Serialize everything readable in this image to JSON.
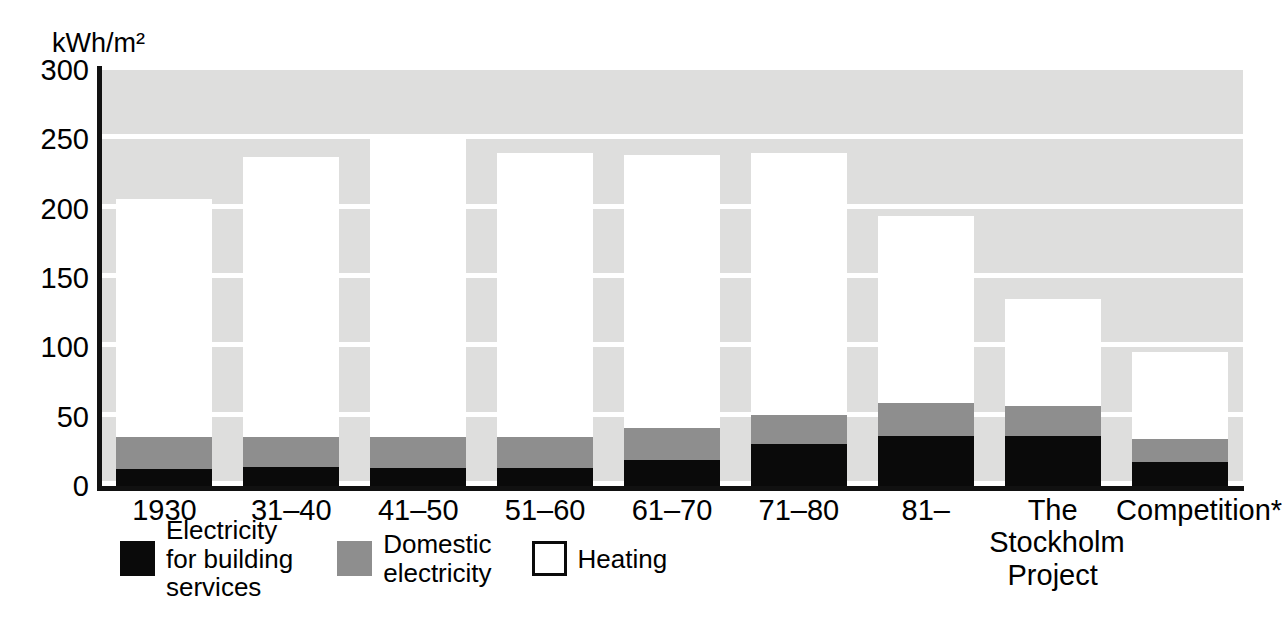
{
  "chart_data": {
    "type": "bar",
    "title": "",
    "subtitle": "",
    "xlabel": "",
    "ylabel": "kWh/m²",
    "ylim": [
      0,
      300
    ],
    "yticks": [
      0,
      50,
      100,
      150,
      200,
      250,
      300
    ],
    "ytick_labels": [
      "0",
      "50",
      "100",
      "150",
      "200",
      "250",
      "300"
    ],
    "grid": "horizontal-bands",
    "stacked": true,
    "legend_position": "below-axis-left",
    "categories": [
      "1930",
      "31–40",
      "41–50",
      "51–60",
      "61–70",
      "71–80",
      "81–",
      "The\nStockholm\nProject",
      "Competition*"
    ],
    "series": [
      {
        "name": "Electricity for building services",
        "color": "#0a0a0a",
        "values": [
          12,
          14,
          13,
          13,
          19,
          30,
          36,
          36,
          17
        ]
      },
      {
        "name": "Domestic electricity",
        "color": "#8e8e8e",
        "values": [
          23,
          21,
          22,
          22,
          23,
          21,
          24,
          22,
          17
        ]
      },
      {
        "name": "Heating",
        "color": "#ffffff",
        "values": [
          172,
          202,
          219,
          205,
          197,
          189,
          135,
          77,
          63
        ]
      }
    ],
    "totals": [
      207,
      237,
      254,
      240,
      239,
      240,
      195,
      135,
      97
    ],
    "annotations": [
      "* Competition"
    ]
  },
  "axis": {
    "unit_label": "kWh/m²"
  },
  "legend": {
    "items": [
      {
        "label": "Electricity\nfor building\nservices",
        "swatch": "black-swatch"
      },
      {
        "label": "Domestic\nelectricity",
        "swatch": "gray-swatch"
      },
      {
        "label": "Heating",
        "swatch": "white-swatch"
      }
    ]
  }
}
